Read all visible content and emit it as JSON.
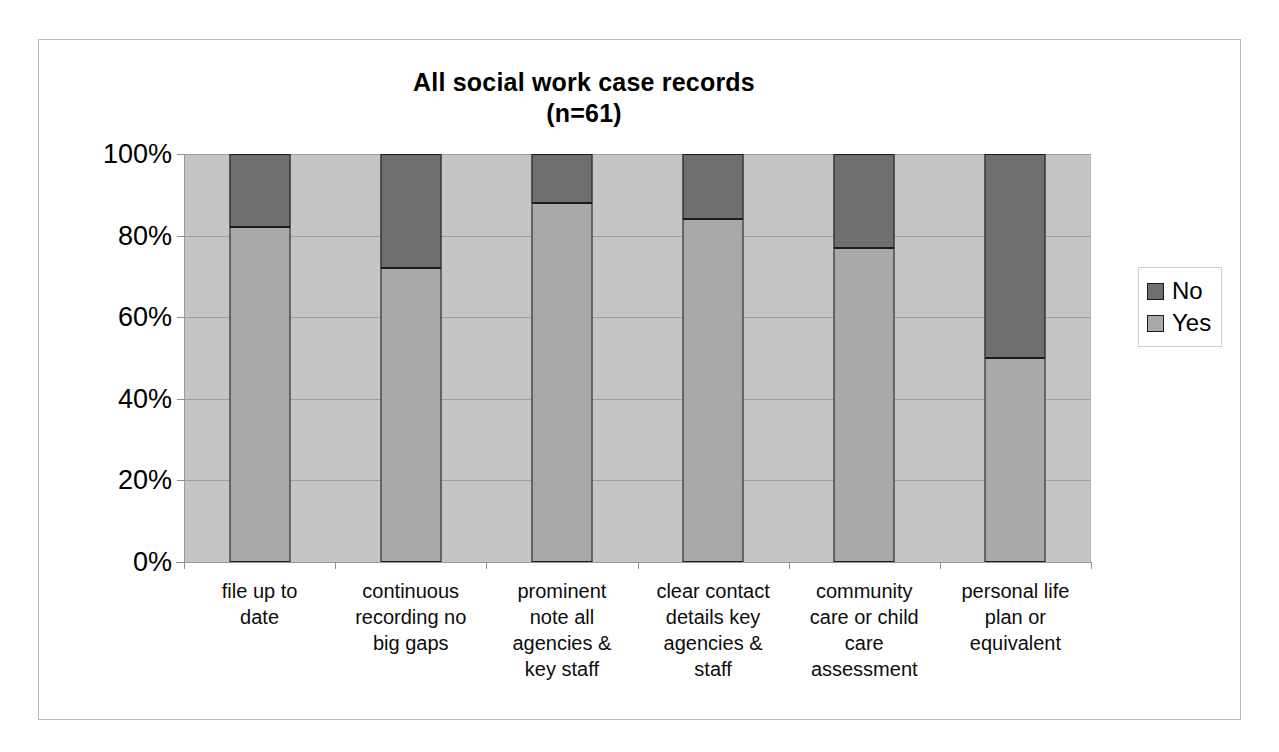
{
  "chart_data": {
    "type": "bar",
    "subtype": "stacked-100-percent",
    "title": "All social work case records",
    "subtitle": "(n=61)",
    "xlabel": "",
    "ylabel": "",
    "ylim": [
      0,
      100
    ],
    "ytick_labels": [
      "0%",
      "20%",
      "40%",
      "60%",
      "80%",
      "100%"
    ],
    "ytick_values": [
      0,
      20,
      40,
      60,
      80,
      100
    ],
    "grid": true,
    "legend_position": "right",
    "categories": [
      "file  up to date",
      "continuous recording no big gaps",
      "prominent note  all agencies & key staff",
      "clear contact details key agencies & staff",
      "community care or child care assessment",
      "personal life plan or equivalent"
    ],
    "category_lines": [
      [
        "file  up to",
        "date"
      ],
      [
        "continuous",
        "recording no",
        "big gaps"
      ],
      [
        "prominent",
        "note  all",
        "agencies &",
        "key staff"
      ],
      [
        "clear contact",
        "details key",
        "agencies &",
        "staff"
      ],
      [
        "community",
        "care or child",
        "care",
        "assessment"
      ],
      [
        "personal life",
        "plan or",
        "equivalent"
      ]
    ],
    "series": [
      {
        "name": "Yes",
        "color": "#a9a9a9",
        "values": [
          82,
          72,
          88,
          84,
          77,
          50
        ]
      },
      {
        "name": "No",
        "color": "#6f6f6f",
        "values": [
          18,
          28,
          12,
          16,
          23,
          50
        ]
      }
    ],
    "legend": [
      {
        "label": "No",
        "color": "#6f6f6f"
      },
      {
        "label": "Yes",
        "color": "#a9a9a9"
      }
    ],
    "plot_background": "#c5c5c5",
    "bar_outline": "#1a1a1a"
  }
}
